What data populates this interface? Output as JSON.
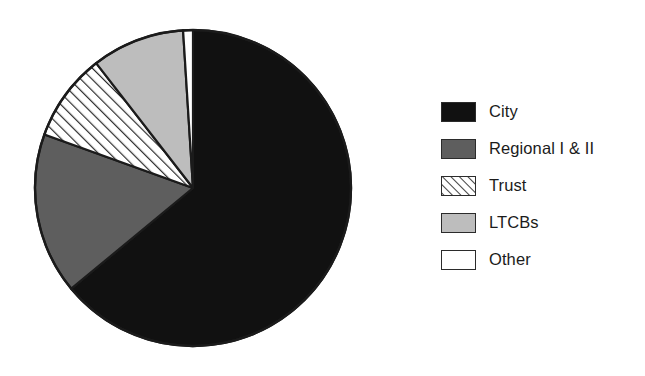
{
  "chart_data": {
    "type": "pie",
    "title": "",
    "subtitle": "",
    "xlabel": "",
    "ylabel": "",
    "grid": false,
    "legend_position": "right",
    "start_angle_deg": 0,
    "direction": "clockwise",
    "categories": [
      "City",
      "Regional I & II",
      "Trust",
      "LTCBs",
      "Other"
    ],
    "values": [
      64.0,
      16.5,
      9.0,
      9.5,
      1.0
    ],
    "units": "percent",
    "slices": [
      {
        "label": "City",
        "value": 64.0,
        "start_deg": 0,
        "end_deg": 230.4,
        "fill": "#111111",
        "pattern": "solid",
        "swatch_icon": "solid-black-swatch"
      },
      {
        "label": "Regional I & II",
        "value": 16.5,
        "start_deg": 230.4,
        "end_deg": 289.8,
        "fill": "#5e5e5e",
        "pattern": "solid",
        "swatch_icon": "solid-darkgray-swatch"
      },
      {
        "label": "Trust",
        "value": 9.0,
        "start_deg": 289.8,
        "end_deg": 322.2,
        "fill": "#ffffff",
        "pattern": "diagonal-hatch",
        "swatch_icon": "hatched-swatch"
      },
      {
        "label": "LTCBs",
        "value": 9.5,
        "start_deg": 322.2,
        "end_deg": 356.4,
        "fill": "#bdbdbd",
        "pattern": "solid",
        "swatch_icon": "solid-lightgray-swatch"
      },
      {
        "label": "Other",
        "value": 1.0,
        "start_deg": 356.4,
        "end_deg": 360.0,
        "fill": "#ffffff",
        "pattern": "solid",
        "swatch_icon": "solid-white-swatch"
      }
    ]
  },
  "colors": {
    "city": "#111111",
    "regional": "#5e5e5e",
    "trust": "#ffffff",
    "ltcbs": "#bdbdbd",
    "other": "#ffffff",
    "outline": "#1b1b1b",
    "background": "#ffffff",
    "text": "#1b1b1b"
  },
  "legend": {
    "items": [
      {
        "label": "City"
      },
      {
        "label": "Regional I & II"
      },
      {
        "label": "Trust"
      },
      {
        "label": "LTCBs"
      },
      {
        "label": "Other"
      }
    ]
  }
}
